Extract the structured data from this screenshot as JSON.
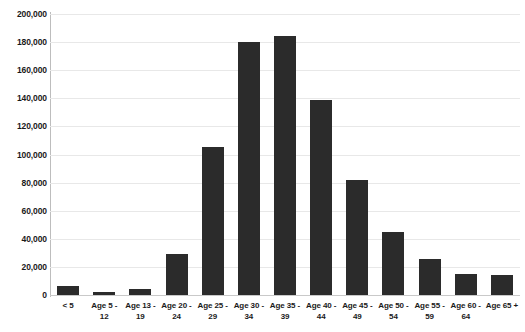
{
  "chart_data": {
    "type": "bar",
    "title": "",
    "subtitle": "",
    "xlabel": "",
    "ylabel": "",
    "ylim": [
      0,
      200000
    ],
    "ytick_step": 20000,
    "grid": true,
    "legend": false,
    "legend_position": "none",
    "bar_color": "#2b2b2b",
    "gridline_color": "#e8e8e8",
    "axis_color": "#bdbdbd",
    "categories": [
      "< 5",
      "Age 5 - 12",
      "Age 13 - 19",
      "Age 20 - 24",
      "Age 25 - 29",
      "Age 30 - 34",
      "Age 35 - 39",
      "Age 40 - 44",
      "Age 45 - 49",
      "Age 50 - 54",
      "Age 55 - 59",
      "Age 60 - 64",
      "Age 65 +"
    ],
    "category_lines": [
      [
        "< 5",
        ""
      ],
      [
        "Age 5 -",
        "12"
      ],
      [
        "Age 13 -",
        "19"
      ],
      [
        "Age 20 -",
        "24"
      ],
      [
        "Age 25 -",
        "29"
      ],
      [
        "Age 30 -",
        "34"
      ],
      [
        "Age 35 -",
        "39"
      ],
      [
        "Age 40 -",
        "44"
      ],
      [
        "Age 45 -",
        "49"
      ],
      [
        "Age 50 -",
        "54"
      ],
      [
        "Age 55 -",
        "59"
      ],
      [
        "Age 60 -",
        "64"
      ],
      [
        "Age 65 +",
        ""
      ]
    ],
    "values": [
      6400,
      2100,
      4300,
      29500,
      105000,
      180000,
      184000,
      138500,
      82000,
      44500,
      25500,
      15000,
      14500
    ],
    "ytick_labels": [
      "0",
      "20,000",
      "40,000",
      "60,000",
      "80,000",
      "100,000",
      "120,000",
      "140,000",
      "160,000",
      "180,000",
      "200,000"
    ],
    "ytick_values": [
      0,
      20000,
      40000,
      60000,
      80000,
      100000,
      120000,
      140000,
      160000,
      180000,
      200000
    ]
  }
}
